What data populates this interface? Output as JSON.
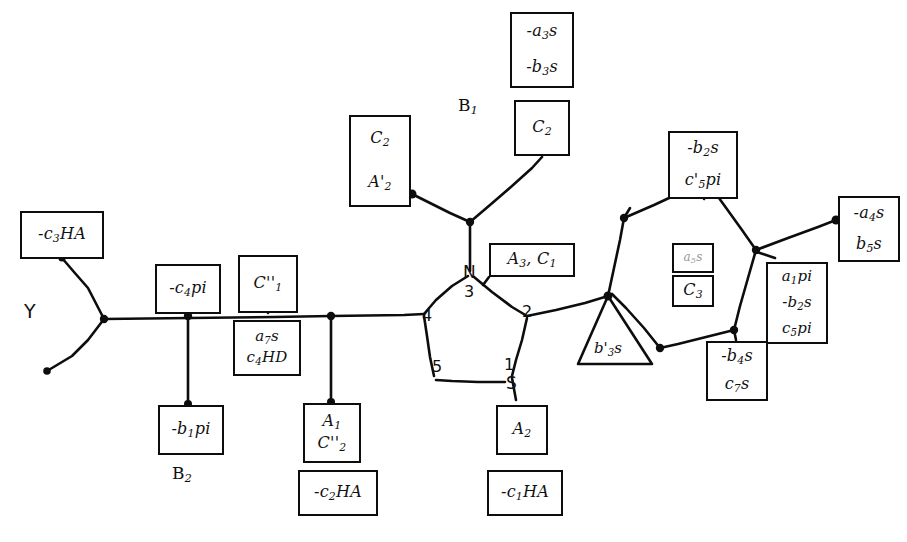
{
  "figure": {
    "type": "chemical-structure-annotation-diagram",
    "stroke_color": "#0d0d0d",
    "background_color": "#ffffff"
  },
  "atoms": {
    "nitrogen": "N",
    "sulfur": "S",
    "ring_positions": [
      "1",
      "2",
      "3",
      "4",
      "5"
    ]
  },
  "free_labels": {
    "b1_group": "B",
    "b1_sub": "1",
    "b2_group": "B",
    "b2_sub": "2",
    "y_marker": "Y"
  },
  "boxes": [
    {
      "id": "box-c3ha",
      "lines": [
        "-c",
        "3",
        "HA"
      ],
      "text": "-c3HA",
      "x": 20,
      "y": 211,
      "w": 84,
      "h": 48
    },
    {
      "id": "box-c4pi",
      "lines": [
        "-c",
        "4",
        "pi"
      ],
      "text": "-c4pi",
      "x": 155,
      "y": 264,
      "w": 66,
      "h": 50
    },
    {
      "id": "box-cpp1",
      "lines": [
        "C''",
        "1"
      ],
      "text": "C''1",
      "x": 238,
      "y": 255,
      "w": 60,
      "h": 58
    },
    {
      "id": "box-a7s-c4hd",
      "lines": [
        "a7s",
        "c4HD"
      ],
      "text": "a7s / c4HD",
      "x": 233,
      "y": 320,
      "w": 68,
      "h": 56
    },
    {
      "id": "box-b1pi",
      "lines": [
        "-b",
        "1",
        "pi"
      ],
      "text": "-b1pi",
      "x": 158,
      "y": 405,
      "w": 66,
      "h": 50
    },
    {
      "id": "box-a1-cpp2",
      "lines": [
        "A1",
        "C''2"
      ],
      "text": "A1 / C''2",
      "x": 303,
      "y": 403,
      "w": 58,
      "h": 60
    },
    {
      "id": "box-c2ha",
      "lines": [
        "-c",
        "2",
        "HA"
      ],
      "text": "-c2HA",
      "x": 298,
      "y": 470,
      "w": 80,
      "h": 46
    },
    {
      "id": "box-c2-ap2",
      "lines": [
        "C2",
        "A'2"
      ],
      "text": "C2 / A'2",
      "x": 349,
      "y": 115,
      "w": 62,
      "h": 92
    },
    {
      "id": "box-a3s-b3s",
      "lines": [
        "-a3s",
        "-b3s"
      ],
      "text": "-a3s / -b3s",
      "x": 510,
      "y": 12,
      "w": 64,
      "h": 76
    },
    {
      "id": "box-c2-top",
      "lines": [
        "C2"
      ],
      "text": "C2",
      "x": 514,
      "y": 100,
      "w": 56,
      "h": 56
    },
    {
      "id": "box-a3-c1",
      "lines": [
        "A3, C1"
      ],
      "text": "A3, C1",
      "x": 489,
      "y": 243,
      "w": 86,
      "h": 34
    },
    {
      "id": "box-a2",
      "lines": [
        "A2"
      ],
      "text": "A2",
      "x": 496,
      "y": 405,
      "w": 52,
      "h": 50
    },
    {
      "id": "box-c1ha",
      "lines": [
        "-c",
        "1",
        "HA"
      ],
      "text": "-c1HA",
      "x": 487,
      "y": 470,
      "w": 76,
      "h": 46
    },
    {
      "id": "box-b2s-c5pi",
      "lines": [
        "-b2s",
        "c'5pi"
      ],
      "text": "-b2s / c'5pi",
      "x": 668,
      "y": 131,
      "w": 70,
      "h": 68
    },
    {
      "id": "box-faint-a5s",
      "lines": [
        "a5s"
      ],
      "text": "a5s",
      "x": 672,
      "y": 243,
      "w": 42,
      "h": 30
    },
    {
      "id": "box-c3-inner",
      "lines": [
        "C3"
      ],
      "text": "C3",
      "x": 672,
      "y": 275,
      "w": 42,
      "h": 32
    },
    {
      "id": "box-a4s-b5s",
      "lines": [
        "-a4s",
        "b5s"
      ],
      "text": "-a4s / b5s",
      "x": 838,
      "y": 196,
      "w": 62,
      "h": 66
    },
    {
      "id": "box-a1pi-b2s-c5pi",
      "lines": [
        "a1pi",
        "-b2s",
        "c5pi"
      ],
      "text": "a1pi / -b2s / c5pi",
      "x": 766,
      "y": 262,
      "w": 62,
      "h": 82
    },
    {
      "id": "box-b4s-c7s",
      "lines": [
        "-b4s",
        "c7s"
      ],
      "text": "-b4s / c7s",
      "x": 706,
      "y": 341,
      "w": 62,
      "h": 60
    },
    {
      "id": "box-triangle-b3s",
      "lines": [
        "b'3s"
      ],
      "text": "b'3s",
      "x": 570,
      "y": 330,
      "w": 80,
      "h": 38
    }
  ],
  "box_text": {
    "c3ha_pre": "-c",
    "c3ha_sub": "3",
    "c3ha_post": "HA",
    "c4pi_pre": "-c",
    "c4pi_sub": "4",
    "c4pi_post": "pi",
    "cpp1_main": "C''",
    "cpp1_sub": "1",
    "a7s_pre": "a",
    "a7s_sub": "7",
    "a7s_post": "s",
    "c4hd_pre": "c",
    "c4hd_sub": "4",
    "c4hd_post": "HD",
    "b1pi_pre": "-b",
    "b1pi_sub": "1",
    "b1pi_post": "pi",
    "a1_main": "A",
    "a1_sub": "1",
    "cpp2_main": "C''",
    "cpp2_sub": "2",
    "c2ha_pre": "-c",
    "c2ha_sub": "2",
    "c2ha_post": "HA",
    "c2_main": "C",
    "c2_sub": "2",
    "ap2_main": "A'",
    "ap2_sub": "2",
    "a3s_pre": "-a",
    "a3s_sub": "3",
    "a3s_post": "s",
    "b3s_pre": "-b",
    "b3s_sub": "3",
    "b3s_post": "s",
    "c2top_main": "C",
    "c2top_sub": "2",
    "a3c1_a": "A",
    "a3c1_a_sub": "3",
    "a3c1_sep": ", ",
    "a3c1_c": "C",
    "a3c1_c_sub": "1",
    "a2_main": "A",
    "a2_sub": "2",
    "c1ha_pre": "-c",
    "c1ha_sub": "1",
    "c1ha_post": "HA",
    "b2s_pre": "-b",
    "b2s_sub": "2",
    "b2s_post": "s",
    "c5pi_pre": "c'",
    "c5pi_sub": "5",
    "c5pi_post": "pi",
    "faint_pre": "a",
    "faint_sub": "5",
    "faint_post": "s",
    "c3_main": "C",
    "c3_sub": "3",
    "a4s_pre": "-a",
    "a4s_sub": "4",
    "a4s_post": "s",
    "b5s_pre": "b",
    "b5s_sub": "5",
    "b5s_post": "s",
    "a1pi_pre": "a",
    "a1pi_sub": "1",
    "a1pi_post": "pi",
    "b2s2_pre": "-b",
    "b2s2_sub": "2",
    "b2s2_post": "s",
    "c5pi2_pre": "c",
    "c5pi2_sub": "5",
    "c5pi2_post": "pi",
    "b4s_pre": "-b",
    "b4s_sub": "4",
    "b4s_post": "s",
    "c7s_pre": "c",
    "c7s_sub": "7",
    "c7s_post": "s",
    "tri_pre": "b'",
    "tri_sub": "3",
    "tri_post": "s"
  }
}
